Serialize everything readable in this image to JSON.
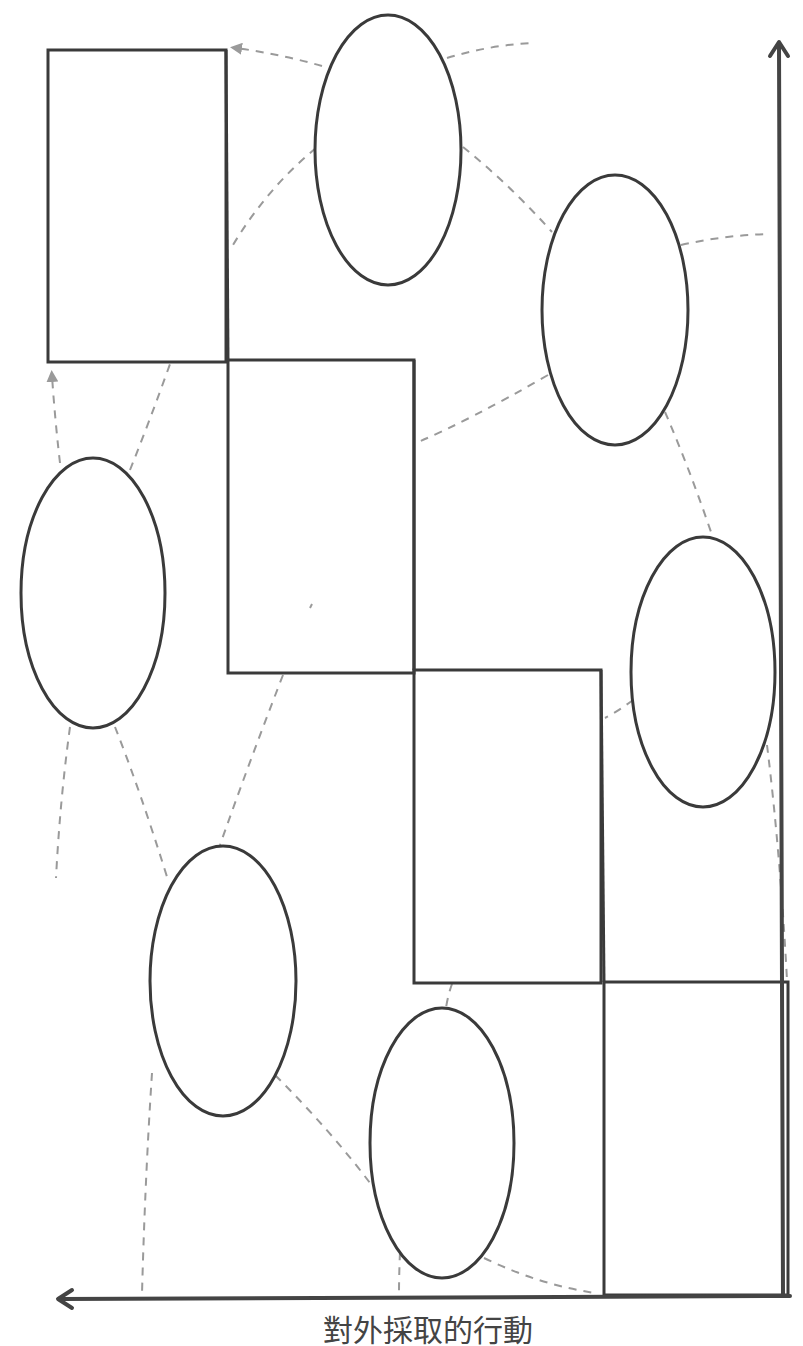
{
  "diagram": {
    "type": "staircase diagram with ovals and dashed connectors",
    "axis_label_bottom": "對外採取的行動",
    "colors": {
      "stroke": "#3a3a3a",
      "dashed": "#9a9a9a",
      "background": "#ffffff"
    },
    "axes": [
      {
        "name": "vertical-axis",
        "direction": "up",
        "x": 778,
        "y_from": 1294,
        "y_to": 40
      },
      {
        "name": "horizontal-axis",
        "direction": "left",
        "y": 1298,
        "x_from": 790,
        "x_to": 58
      }
    ],
    "steps": [
      {
        "x": 48,
        "y": 50,
        "w": 178,
        "h": 312
      },
      {
        "x": 230,
        "y": 360,
        "w": 184,
        "h": 313
      },
      {
        "x": 414,
        "y": 670,
        "w": 187,
        "h": 313
      },
      {
        "x": 604,
        "y": 982,
        "w": 184,
        "h": 313
      }
    ],
    "ovals": [
      {
        "cx": 388,
        "cy": 150,
        "rx": 73,
        "ry": 135
      },
      {
        "cx": 615,
        "cy": 310,
        "rx": 73,
        "ry": 135
      },
      {
        "cx": 93,
        "cy": 593,
        "rx": 72,
        "ry": 135
      },
      {
        "cx": 703,
        "cy": 672,
        "rx": 72,
        "ry": 135
      },
      {
        "cx": 223,
        "cy": 981,
        "rx": 73,
        "ry": 135
      },
      {
        "cx": 442,
        "cy": 1143,
        "rx": 72,
        "ry": 135
      }
    ]
  }
}
